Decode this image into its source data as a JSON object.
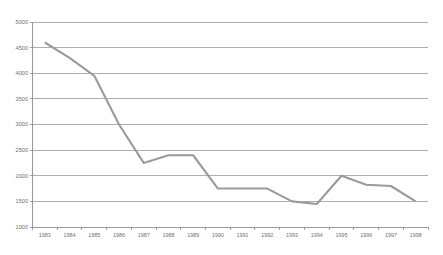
{
  "chart_data": {
    "type": "line",
    "title": "",
    "subtitle": "",
    "xlabel": "",
    "ylabel": "",
    "grid": true,
    "legend": false,
    "legend_position": "none",
    "line_color": "#9b9b9b",
    "grid_color": "#9a9a9a",
    "axis_color": "#8d8d8d",
    "label_color": "#6f6f6f",
    "background_color": "#ffffff",
    "ylim": [
      1000,
      5000
    ],
    "ytick_step": 500,
    "ytick_labels": [
      "1000",
      "1500",
      "2000",
      "2500",
      "3000",
      "3500",
      "4000",
      "4500",
      "5000"
    ],
    "ytick_values": [
      1000,
      1500,
      2000,
      2500,
      3000,
      3500,
      4000,
      4500,
      5000
    ],
    "categories": [
      "1983",
      "1984",
      "1985",
      "1986",
      "1987",
      "1988",
      "1989",
      "1990",
      "1991",
      "1992",
      "1993",
      "1994",
      "1995",
      "1996",
      "1997",
      "1998"
    ],
    "x": [
      1983,
      1984,
      1985,
      1986,
      1987,
      1988,
      1989,
      1990,
      1991,
      1992,
      1993,
      1994,
      1995,
      1996,
      1997,
      1998
    ],
    "values": [
      4600,
      4300,
      3950,
      3000,
      2250,
      2400,
      2400,
      1750,
      1750,
      1750,
      1500,
      1450,
      2000,
      1825,
      1800,
      1500
    ],
    "series": [
      {
        "name": "series-1",
        "values": [
          4600,
          4300,
          3950,
          3000,
          2250,
          2400,
          2400,
          1750,
          1750,
          1750,
          1500,
          1450,
          2000,
          1825,
          1800,
          1500
        ]
      }
    ],
    "annotations": []
  },
  "caption": {
    "text": ""
  }
}
